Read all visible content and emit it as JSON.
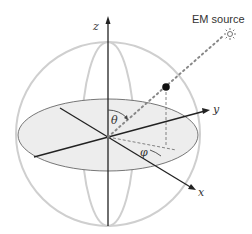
{
  "diagram": {
    "labels": {
      "z_axis": "z",
      "y_axis": "y",
      "x_axis": "x",
      "theta": "θ",
      "phi": "φ",
      "source": "EM source"
    },
    "icons": {
      "source": "sun-icon"
    },
    "colors": {
      "sphere_outline": "#cccccc",
      "equator_fill": "#ececec",
      "axis": "#222222",
      "ray": "#777777",
      "point": "#111111",
      "text": "#333333"
    }
  }
}
